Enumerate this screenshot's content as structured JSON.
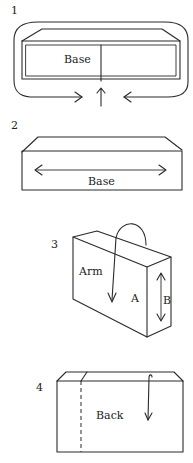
{
  "diagram": {
    "panels": [
      {
        "number": "1",
        "labels": [
          "Base"
        ]
      },
      {
        "number": "2",
        "labels": [
          "Base"
        ]
      },
      {
        "number": "3",
        "labels": [
          "Arm",
          "A",
          "B"
        ]
      },
      {
        "number": "4",
        "labels": [
          "Back"
        ]
      }
    ]
  },
  "colors": {
    "line": "#2a2a2a",
    "text": "#222222",
    "background": "#ffffff"
  }
}
